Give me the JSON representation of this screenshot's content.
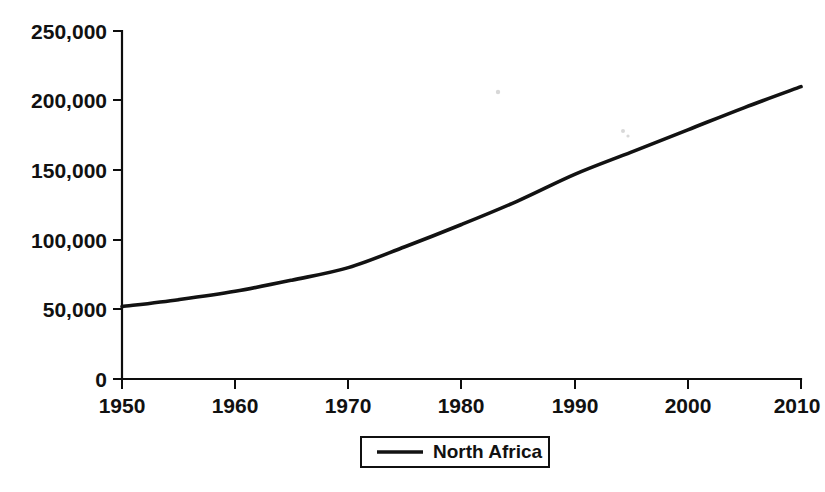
{
  "chart_data": {
    "type": "line",
    "title": "",
    "subtitle": "",
    "xlabel": "",
    "ylabel": "",
    "xlim": [
      1950,
      2010
    ],
    "ylim": [
      0,
      250000
    ],
    "grid": false,
    "legend_position": "bottom-center",
    "x_tick_labels": [
      "1950",
      "1960",
      "1970",
      "1980",
      "1990",
      "2000",
      "2010"
    ],
    "x_ticks": [
      1950,
      1960,
      1970,
      1980,
      1990,
      2000,
      2010
    ],
    "y_tick_labels": [
      "0",
      "50,000",
      "100,000",
      "150,000",
      "200,000",
      "250,000"
    ],
    "y_ticks": [
      0,
      50000,
      100000,
      150000,
      200000,
      250000
    ],
    "x": [
      1950,
      1955,
      1960,
      1965,
      1970,
      1975,
      1980,
      1985,
      1990,
      1995,
      2000,
      2005,
      2010
    ],
    "series": [
      {
        "name": "North Africa",
        "color": "#121212",
        "values": [
          52000,
          57000,
          63000,
          71000,
          80000,
          95000,
          111000,
          128000,
          147000,
          163000,
          179000,
          195000,
          210000
        ]
      }
    ],
    "legend": [
      {
        "label": "North Africa",
        "color": "#121212"
      }
    ],
    "annotations": []
  },
  "axes": {
    "y_axis_name": "population-axis",
    "x_axis_name": "year-axis"
  }
}
